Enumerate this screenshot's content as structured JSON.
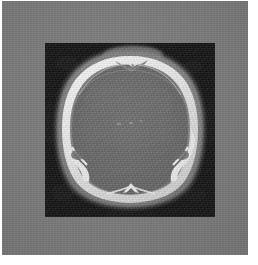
{
  "image": {
    "kind": "medical-ct-scan",
    "modality": "CT",
    "body_part": "head",
    "plane": "axial",
    "width": 258,
    "height": 265,
    "caption_text": "",
    "overlay_text": ""
  },
  "frame": {
    "name": "gray-mount",
    "color": "#7b7b7b",
    "x": 2,
    "y": 1,
    "width": 246,
    "height": 254
  },
  "page": {
    "background_color": "#ffffff"
  },
  "scan_panel": {
    "name": "ct-image-panel",
    "background_color": "#141414",
    "x": 43,
    "y": 42,
    "width": 170,
    "height": 174
  },
  "anatomy": {
    "structures": [
      {
        "name": "scalp-soft-tissue",
        "label": "Scalp / soft tissue",
        "color": "#8e8e8e"
      },
      {
        "name": "skull-bone-cortex",
        "label": "Calvarial bone",
        "color": "#f2f2f2"
      },
      {
        "name": "diploic-space",
        "label": "Diploe",
        "color": "#b4b4b4"
      },
      {
        "name": "brain-parenchyma",
        "label": "Brain parenchyma",
        "color": "#6e6e6e"
      },
      {
        "name": "occipital-protuberance",
        "label": "Internal occipital protuberance",
        "color": "#ededed"
      },
      {
        "name": "sagittal-suture-notch",
        "label": "Sagittal suture notch",
        "color": "#d8d8d8"
      },
      {
        "name": "mastoid-notch-left",
        "label": "Left mastoid notch",
        "color": "#efefef"
      },
      {
        "name": "mastoid-notch-right",
        "label": "Right mastoid notch",
        "color": "#efefef"
      },
      {
        "name": "calcification-speck",
        "label": "Central calcification",
        "color": "#a9a9a9"
      }
    ],
    "window": {
      "air_color": "#141414",
      "bone_color": "#f5f5f5",
      "soft_tissue_color": "#6e6e6e"
    }
  }
}
